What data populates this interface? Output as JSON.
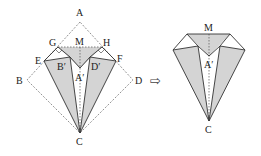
{
  "figure_left": {
    "labels": {
      "A": "A",
      "B": "B",
      "C": "C",
      "D": "D",
      "E": "E",
      "F": "F",
      "G": "G",
      "H": "H",
      "M": "M",
      "B_prime": "B′",
      "D_prime": "D′",
      "A_prime": "A′"
    }
  },
  "arrow": {
    "symbol": "⇨"
  },
  "figure_right": {
    "labels": {
      "M": "M",
      "A_prime": "A′",
      "C": "C"
    }
  },
  "colors": {
    "shade": "#d4d4d4",
    "line": "#333333",
    "dashed": "#555555"
  }
}
